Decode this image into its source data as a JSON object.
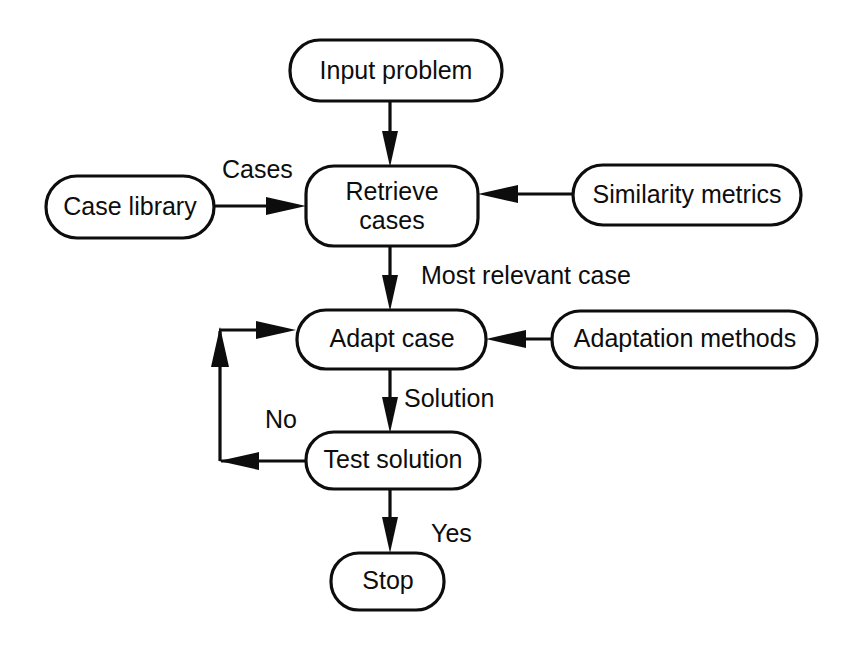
{
  "diagram": {
    "background_color": "#ffffff",
    "line_color": "#0d0d0d",
    "nodes": {
      "input_problem": "Input problem",
      "case_library": "Case library",
      "retrieve_cases_line1": "Retrieve",
      "retrieve_cases_line2": "cases",
      "similarity_metrics": "Similarity metrics",
      "adapt_case": "Adapt case",
      "adaptation_methods": "Adaptation methods",
      "test_solution": "Test solution",
      "stop": "Stop"
    },
    "edge_labels": {
      "cases": "Cases",
      "most_relevant_case": "Most relevant case",
      "solution": "Solution",
      "no": "No",
      "yes": "Yes"
    }
  }
}
